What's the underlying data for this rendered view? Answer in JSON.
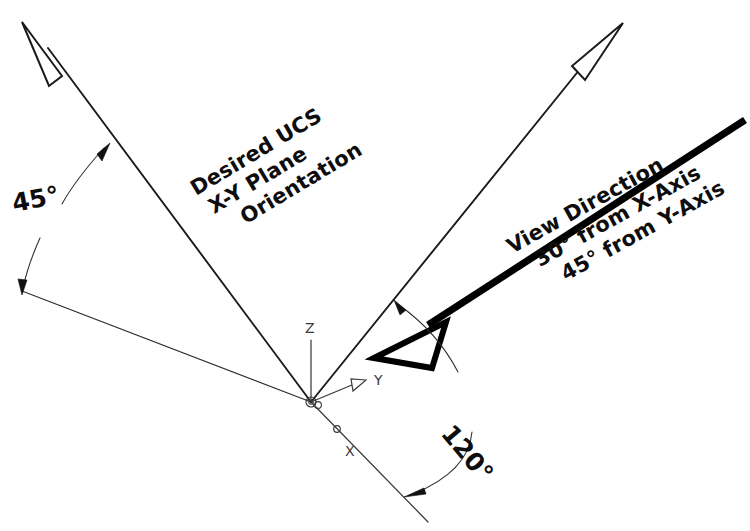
{
  "diagram": {
    "background_color": "#ffffff",
    "line_color": "#1a1a1a",
    "bold_line_color": "#000000",
    "dim_line_color": "#2b2b2b",
    "ucs_color": "#3a3a3a",
    "annotations": {
      "ucs_note": {
        "line1": "Desired UCS",
        "line2": "X-Y Plane",
        "line3": "Orientation"
      },
      "view_note": {
        "line1": "View Direction",
        "line2": "30° from X-Axis",
        "line3": "45° from Y-Axis"
      }
    },
    "dimensions": {
      "angle_ucs": {
        "value": "45",
        "unit": "°",
        "label": "45°"
      },
      "angle_view": {
        "value": "120",
        "unit": "°",
        "label": "120°"
      }
    },
    "ucs_icon": {
      "origin_label": "",
      "z_axis_label": "Z",
      "y_axis_label": "Y",
      "x_axis_label": "X"
    }
  }
}
